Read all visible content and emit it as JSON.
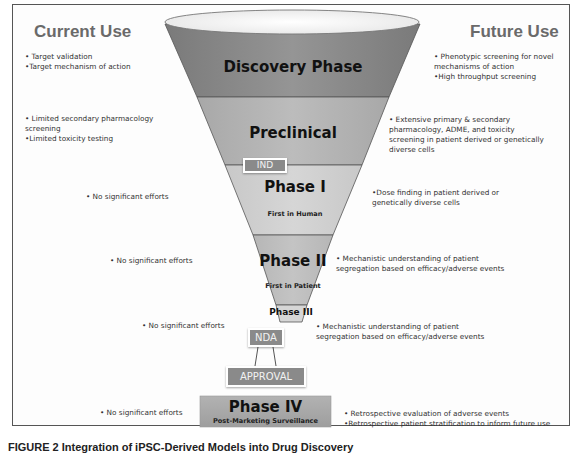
{
  "headings": {
    "left": "Current Use",
    "right": "Future Use"
  },
  "colors": {
    "discovery": "#8c8c8c",
    "preclinical": "#b4b4b4",
    "phase1": "#cfcfcf",
    "phase2": "#bdbdbd",
    "phase3": "#d6d6d6",
    "milestone_box": "#8a8a8a",
    "phase4": "#a9a9a9",
    "rim": "#f4f4f4"
  },
  "stages": {
    "discovery": {
      "label": "Discovery Phase"
    },
    "preclinical": {
      "label": "Preclinical"
    },
    "ind": {
      "label": "IND"
    },
    "phase1": {
      "label": "Phase I",
      "sublabel": "First in Human"
    },
    "phase2": {
      "label": "Phase II",
      "sublabel": "First in Patient"
    },
    "phase3": {
      "label": "Phase III"
    },
    "nda": {
      "label": "NDA"
    },
    "approval": {
      "label": "APPROVAL"
    },
    "phase4": {
      "label": "Phase IV",
      "sublabel": "Post-Marketing Surveillance"
    }
  },
  "current_use": {
    "discovery": [
      "• Target validation",
      "•Target mechanism of action"
    ],
    "preclinical": [
      "• Limited  secondary pharmacology",
      "screening",
      "•Limited toxicity testing"
    ],
    "phase1": [
      "• No significant efforts"
    ],
    "phase2": [
      "• No significant efforts"
    ],
    "phase3": [
      "• No significant efforts"
    ],
    "phase4": [
      "• No significant efforts"
    ]
  },
  "future_use": {
    "discovery": [
      "• Phenotypic screening for novel",
      "mechanisms of action",
      "•High throughput screening"
    ],
    "preclinical": [
      "• Extensive primary & secondary",
      "pharmacology, ADME, and toxicity",
      "screening in patient derived or genetically",
      "diverse cells"
    ],
    "phase1": [
      "•Dose finding in patient derived or",
      "genetically diverse cells"
    ],
    "phase2": [
      "• Mechanistic understanding of patient",
      "segregation based on efficacy/adverse events"
    ],
    "phase3": [
      "• Mechanistic understanding of patient",
      "segregation based on efficacy/adverse events"
    ],
    "phase4": [
      "• Retrospective evaluation of adverse events",
      "•Retrospective patient stratification to inform future use"
    ]
  },
  "caption": "FIGURE 2  Integration of iPSC-Derived Models into Drug Discovery"
}
